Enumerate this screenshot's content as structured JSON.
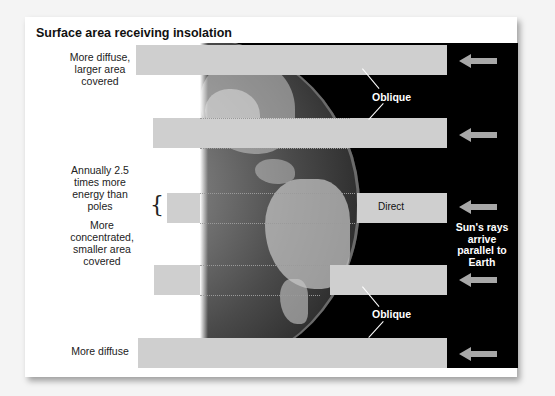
{
  "title": "Surface area receiving insolation",
  "left_labels": {
    "top": "More diffuse, larger area covered",
    "annual": "Annually 2.5 times more energy than poles",
    "concentrated": "More concentrated, smaller area covered",
    "bottom": "More diffuse"
  },
  "bands": [
    {
      "id": "band-1",
      "label": ""
    },
    {
      "id": "band-2",
      "label": ""
    },
    {
      "id": "band-3",
      "label": "Direct"
    },
    {
      "id": "band-4",
      "label": ""
    },
    {
      "id": "band-5",
      "label": ""
    }
  ],
  "oblique_top": "Oblique",
  "oblique_bottom": "Oblique",
  "sun_text": "Sun's rays arrive parallel to Earth",
  "colors": {
    "band": "#cfcfcf",
    "space": "#000000",
    "arrow": "#a8a8a8"
  }
}
